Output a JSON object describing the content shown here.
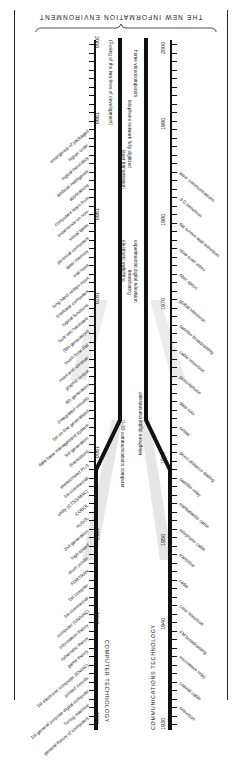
{
  "title": "THE NEW INFORMATION ENVIRONMENT",
  "axes": {
    "left_title": "COMPUTER TECHNOLOGY",
    "right_title": "COMMUNICATIONS TECHNOLOGY",
    "years": [
      "1930",
      "1940",
      "1950",
      "1960",
      "1970",
      "1980",
      "1990",
      "2000"
    ]
  },
  "central": {
    "fusing_note": "(Fusing of the two lines of development)",
    "items": [
      "D-30 communications computer",
      "telephone digital transmission",
      "electronic switching",
      "timesharing",
      "experimental digital television",
      "laser transmission",
      "telephone network fully digitized",
      "home videocomputers"
    ]
  },
  "computer_events": [
    "general theory of computers",
    "Turing machine",
    "1st general purpose digital computer",
    "printed circuits",
    "1st electronic computer (ENIAC)",
    "game theory",
    "cybernetic theory",
    "information theory",
    "computer (UNIVAC)",
    "1st commercial",
    "1st compiler",
    "FORTRAN",
    "drum printer",
    "high speed",
    "2nd generation",
    "ALGOL",
    "COBOL",
    "utility (CTSS/MAC)",
    "1st commercial",
    "skeletonized PL/1",
    "(transistors)",
    "3rd generation",
    "data base management system",
    "1st on-line generalized",
    "(integrated circuits)",
    "4th generation",
    "graphic output",
    "input and retrieval",
    "touch tone dial",
    "(5th generation)",
    "built into hardware",
    "logical functions",
    "briefcase computers",
    "long hand written input",
    "oral input",
    "laser memory",
    "personal computers",
    "visual tasks",
    "experience on non-",
    "computers learn from",
    "applications",
    "artificial intelligence",
    "logical-heuristics",
    "higher order",
    "emergence of packaged"
  ],
  "communications_events": [
    "television",
    "coaxial cable",
    "microwave relay",
    "FM broadcasting",
    "color television",
    "radar",
    "transistor",
    "telephone cable",
    "transatlantic cable",
    "satellite relay",
    "direct distance dialing",
    "telstar",
    "data sets",
    "picturephone",
    "cable television",
    "satellite broadcasting",
    "global television",
    "fiber optics",
    "slow scan video",
    "flat screen wall television",
    "3-D television",
    "laser communications"
  ],
  "colors": {
    "ink": "#111111",
    "paper": "#ffffff",
    "fade": "#d8d8d8"
  }
}
